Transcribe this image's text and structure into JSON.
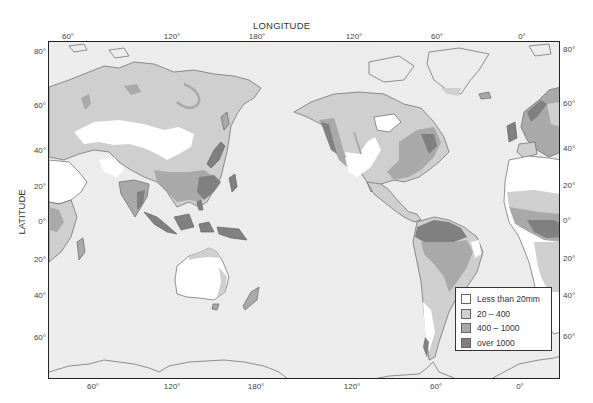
{
  "map": {
    "x_axis_title": "LONGITUDE",
    "y_axis_title": "LATITUDE",
    "longitude_ticks_top": [
      {
        "label": "60°",
        "x": 68
      },
      {
        "label": "120°",
        "x": 172
      },
      {
        "label": "180°",
        "x": 257
      },
      {
        "label": "120°",
        "x": 354
      },
      {
        "label": "60°",
        "x": 437
      },
      {
        "label": "0°",
        "x": 522
      }
    ],
    "longitude_ticks_bottom": [
      {
        "label": "60°",
        "x": 93
      },
      {
        "label": "120°",
        "x": 172
      },
      {
        "label": "180°",
        "x": 256
      },
      {
        "label": "120°",
        "x": 352
      },
      {
        "label": "60°",
        "x": 436
      },
      {
        "label": "0°",
        "x": 520
      }
    ],
    "latitude_ticks_left": [
      {
        "label": "80°",
        "y": 51
      },
      {
        "label": "60°",
        "y": 105
      },
      {
        "label": "40°",
        "y": 150
      },
      {
        "label": "20°",
        "y": 186
      },
      {
        "label": "0°",
        "y": 221
      },
      {
        "label": "20°",
        "y": 259
      },
      {
        "label": "40°",
        "y": 295
      },
      {
        "label": "60°",
        "y": 337
      }
    ],
    "latitude_ticks_right": [
      {
        "label": "80°",
        "y": 49
      },
      {
        "label": "60°",
        "y": 103
      },
      {
        "label": "40°",
        "y": 148
      },
      {
        "label": "20°",
        "y": 185
      },
      {
        "label": "0°",
        "y": 220
      },
      {
        "label": "20°",
        "y": 258
      },
      {
        "label": "40°",
        "y": 295
      },
      {
        "label": "60°",
        "y": 336
      }
    ],
    "ocean_color": "#ececec",
    "coastline_color": "#666666"
  },
  "legend": {
    "items": [
      {
        "label": "Less than 20mm",
        "color": "#ffffff"
      },
      {
        "label": "20 – 400",
        "color": "#cfcfcf"
      },
      {
        "label": "400 – 1000",
        "color": "#a9a9a9"
      },
      {
        "label": "over 1000",
        "color": "#808080"
      }
    ]
  }
}
